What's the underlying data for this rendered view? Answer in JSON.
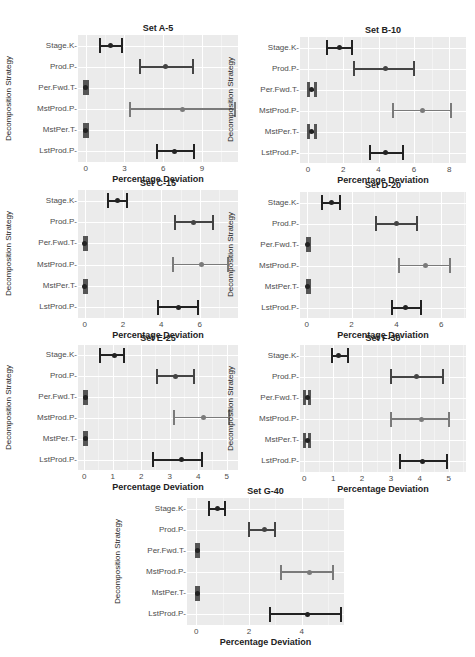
{
  "figure": {
    "ylabel": "Decomposition Strategy",
    "xlabel": "Percentage Deviation",
    "categories": [
      "Stage.K",
      "Prod.P",
      "Per.Fwd.T",
      "MstProd.P",
      "MstPer.T",
      "LstProd.P"
    ],
    "colors": {
      "panel_bg": "#ebebeb",
      "grid": "#ffffff",
      "dark_bar": "#222222",
      "mid_bar": "#444444",
      "light_bar": "#7a7a7a"
    }
  },
  "chart_data": [
    {
      "type": "errorbar",
      "title": "Set A-5",
      "xlabel": "Percentage Deviation",
      "ylabel": "Decomposition Strategy",
      "xticks": [
        0,
        3,
        6,
        9
      ],
      "xlim": [
        -0.6,
        11.8
      ],
      "categories": [
        "Stage.K",
        "Prod.P",
        "Per.Fwd.T",
        "MstProd.P",
        "MstPer.T",
        "LstProd.P"
      ],
      "mean": [
        1.9,
        6.2,
        0.0,
        7.5,
        0.0,
        6.9
      ],
      "lower": [
        1.1,
        4.2,
        -0.1,
        3.4,
        -0.1,
        5.5
      ],
      "upper": [
        2.8,
        8.3,
        0.1,
        11.6,
        0.1,
        8.4
      ]
    },
    {
      "type": "errorbar",
      "title": "Set B-10",
      "xlabel": "Percentage Deviation",
      "ylabel": "Decomposition Strategy",
      "xticks": [
        0,
        2,
        4,
        6,
        8
      ],
      "xlim": [
        -0.45,
        8.95
      ],
      "categories": [
        "Stage.K",
        "Prod.P",
        "Per.Fwd.T",
        "MstProd.P",
        "MstPer.T",
        "LstProd.P"
      ],
      "mean": [
        1.8,
        4.4,
        0.2,
        6.5,
        0.2,
        4.4
      ],
      "lower": [
        1.1,
        2.6,
        0.0,
        4.8,
        0.0,
        3.5
      ],
      "upper": [
        2.5,
        6.0,
        0.4,
        8.1,
        0.4,
        5.4
      ]
    },
    {
      "type": "errorbar",
      "title": "Set C-15",
      "xlabel": "Percentage Deviation",
      "ylabel": "Decomposition Strategy",
      "xticks": [
        0,
        2,
        4,
        6
      ],
      "xlim": [
        -0.35,
        8.0
      ],
      "categories": [
        "Stage.K",
        "Prod.P",
        "Per.Fwd.T",
        "MstProd.P",
        "MstPer.T",
        "LstProd.P"
      ],
      "mean": [
        1.7,
        5.7,
        0.0,
        6.1,
        0.0,
        4.9
      ],
      "lower": [
        1.2,
        4.7,
        -0.05,
        4.6,
        -0.05,
        3.8
      ],
      "upper": [
        2.2,
        6.7,
        0.05,
        7.5,
        0.05,
        5.9
      ]
    },
    {
      "type": "errorbar",
      "title": "Set D-20",
      "xlabel": "Percentage Deviation",
      "ylabel": "Decomposition Strategy",
      "xticks": [
        0,
        2,
        4,
        6
      ],
      "xlim": [
        -0.3,
        7.1
      ],
      "categories": [
        "Stage.K",
        "Prod.P",
        "Per.Fwd.T",
        "MstProd.P",
        "MstPer.T",
        "LstProd.P"
      ],
      "mean": [
        1.1,
        4.0,
        0.05,
        5.3,
        0.05,
        4.4
      ],
      "lower": [
        0.7,
        3.1,
        0.0,
        4.1,
        0.0,
        3.8
      ],
      "upper": [
        1.5,
        4.9,
        0.1,
        6.4,
        0.1,
        5.1
      ]
    },
    {
      "type": "errorbar",
      "title": "Set E-25",
      "xlabel": "Percentage Deviation",
      "ylabel": "Decomposition Strategy",
      "xticks": [
        0,
        1,
        2,
        3,
        4,
        5
      ],
      "xlim": [
        -0.22,
        5.4
      ],
      "categories": [
        "Stage.K",
        "Prod.P",
        "Per.Fwd.T",
        "MstProd.P",
        "MstPer.T",
        "LstProd.P"
      ],
      "mean": [
        1.05,
        3.2,
        0.03,
        4.2,
        0.03,
        3.4
      ],
      "lower": [
        0.55,
        2.55,
        0.0,
        3.15,
        0.0,
        2.4
      ],
      "upper": [
        1.4,
        3.85,
        0.06,
        5.1,
        0.06,
        4.15
      ]
    },
    {
      "type": "errorbar",
      "title": "Set F-30",
      "xlabel": "Percentage Deviation",
      "ylabel": "Decomposition Strategy",
      "xticks": [
        0,
        1,
        2,
        3,
        4,
        5
      ],
      "xlim": [
        -0.15,
        5.6
      ],
      "categories": [
        "Stage.K",
        "Prod.P",
        "Per.Fwd.T",
        "MstProd.P",
        "MstPer.T",
        "LstProd.P"
      ],
      "mean": [
        1.2,
        3.9,
        0.1,
        4.05,
        0.1,
        4.1
      ],
      "lower": [
        0.95,
        3.0,
        0.0,
        3.0,
        0.0,
        3.3
      ],
      "upper": [
        1.5,
        4.8,
        0.15,
        5.0,
        0.15,
        4.95
      ]
    },
    {
      "type": "errorbar",
      "title": "Set G-40",
      "xlabel": "Percentage Deviation",
      "ylabel": "Decomposition Strategy",
      "xticks": [
        0,
        2,
        4
      ],
      "xlim": [
        -0.35,
        5.6
      ],
      "categories": [
        "Stage.K",
        "Prod.P",
        "Per.Fwd.T",
        "MstProd.P",
        "MstPer.T",
        "LstProd.P"
      ],
      "mean": [
        0.8,
        2.6,
        0.03,
        4.3,
        0.03,
        4.2
      ],
      "lower": [
        0.5,
        2.0,
        0.0,
        3.2,
        0.0,
        2.8
      ],
      "upper": [
        1.1,
        3.0,
        0.06,
        5.2,
        0.06,
        5.5
      ]
    }
  ],
  "layout": [
    {
      "plot": [
        78,
        35,
        160,
        127
      ]
    },
    {
      "plot": [
        300,
        37,
        166,
        126
      ]
    },
    {
      "plot": [
        78,
        190,
        160,
        128
      ]
    },
    {
      "plot": [
        300,
        192,
        166,
        126
      ]
    },
    {
      "plot": [
        78,
        345,
        160,
        125
      ]
    },
    {
      "plot": [
        300,
        345,
        166,
        127
      ]
    },
    {
      "plot": [
        187,
        498,
        157,
        127
      ]
    }
  ]
}
